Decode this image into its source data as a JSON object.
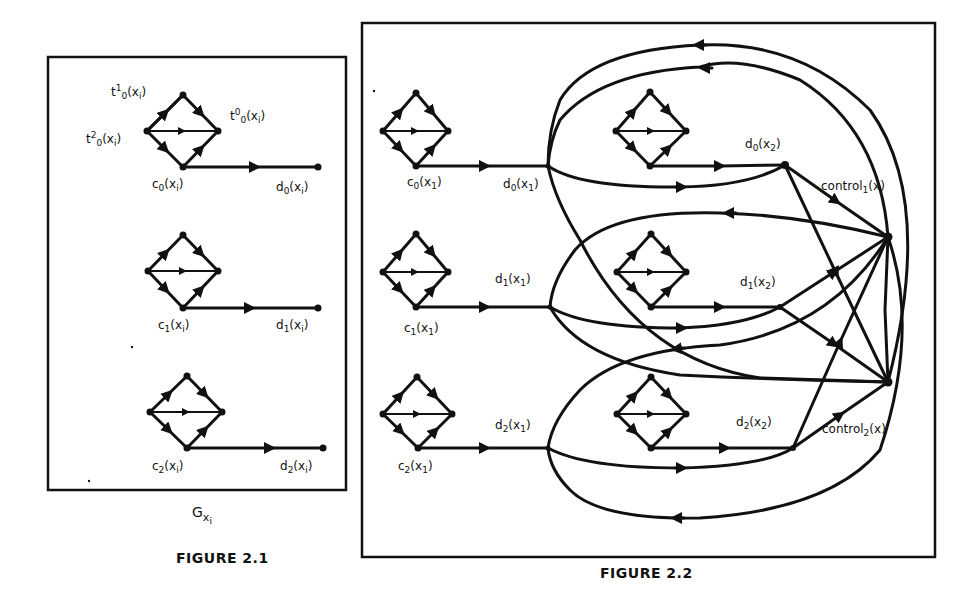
{
  "figure_2_1": {
    "caption": "FIGURE 2.1",
    "graph_label": "G",
    "graph_label_sub": "x",
    "graph_label_subsub": "i",
    "top_labels": {
      "t1": "t",
      "t1_sup": "1",
      "t1_sub": "0",
      "t1_arg": "(x",
      "t1_arg_sub": "i",
      "t1_close": ")",
      "t0": "t",
      "t0_sup": "0",
      "t0_sub": "0",
      "t0_arg": "(x",
      "t0_arg_sub": "i",
      "t0_close": ")",
      "t2": "t",
      "t2_sup": "2",
      "t2_sub": "0",
      "t2_arg": "(x",
      "t2_arg_sub": "i",
      "t2_close": ")"
    },
    "rows": [
      {
        "c_label": "c",
        "c_sub": "0",
        "c_arg": "(x",
        "c_arg_sub": "i",
        "c_close": ")",
        "d_label": "d",
        "d_sub": "0",
        "d_arg": "(x",
        "d_arg_sub": "i",
        "d_close": ")"
      },
      {
        "c_label": "c",
        "c_sub": "1",
        "c_arg": "(x",
        "c_arg_sub": "i",
        "c_close": ")",
        "d_label": "d",
        "d_sub": "1",
        "d_arg": "(x",
        "d_arg_sub": "i",
        "d_close": ")"
      },
      {
        "c_label": "c",
        "c_sub": "2",
        "c_arg": "(x",
        "c_arg_sub": "i",
        "c_close": ")",
        "d_label": "d",
        "d_sub": "2",
        "d_arg": "(x",
        "d_arg_sub": "i",
        "d_close": ")"
      }
    ]
  },
  "figure_2_2": {
    "caption": "FIGURE 2.2",
    "left_rows": [
      {
        "c_label": "c",
        "c_sub": "0",
        "c_arg": "(x",
        "c_arg_sub": "1",
        "c_close": ")",
        "d_label": "d",
        "d_sub": "0",
        "d_arg": "(x",
        "d_arg_sub": "1",
        "d_close": ")"
      },
      {
        "c_label": "c",
        "c_sub": "1",
        "c_arg": "(x",
        "c_arg_sub": "1",
        "c_close": ")",
        "d_label": "d",
        "d_sub": "1",
        "d_arg": "(x",
        "d_arg_sub": "1",
        "d_close": ")"
      },
      {
        "c_label": "c",
        "c_sub": "2",
        "c_arg": "(x",
        "c_arg_sub": "1",
        "c_close": ")",
        "d_label": "d",
        "d_sub": "2",
        "d_arg": "(x",
        "d_arg_sub": "1",
        "d_close": ")"
      }
    ],
    "right_rows": [
      {
        "d_label": "d",
        "d_sub": "0",
        "d_arg": "(x",
        "d_arg_sub": "2",
        "d_close": ")"
      },
      {
        "d_label": "d",
        "d_sub": "1",
        "d_arg": "(x",
        "d_arg_sub": "2",
        "d_close": ")"
      },
      {
        "d_label": "d",
        "d_sub": "2",
        "d_arg": "(x",
        "d_arg_sub": "2",
        "d_close": ")"
      }
    ],
    "control_labels": [
      {
        "text": "control",
        "sub": "1",
        "arg": "(x)"
      },
      {
        "text": "control",
        "sub": "2",
        "arg": "(x)"
      }
    ]
  },
  "colors": {
    "ink": "#111111",
    "paper": "#ffffff"
  }
}
